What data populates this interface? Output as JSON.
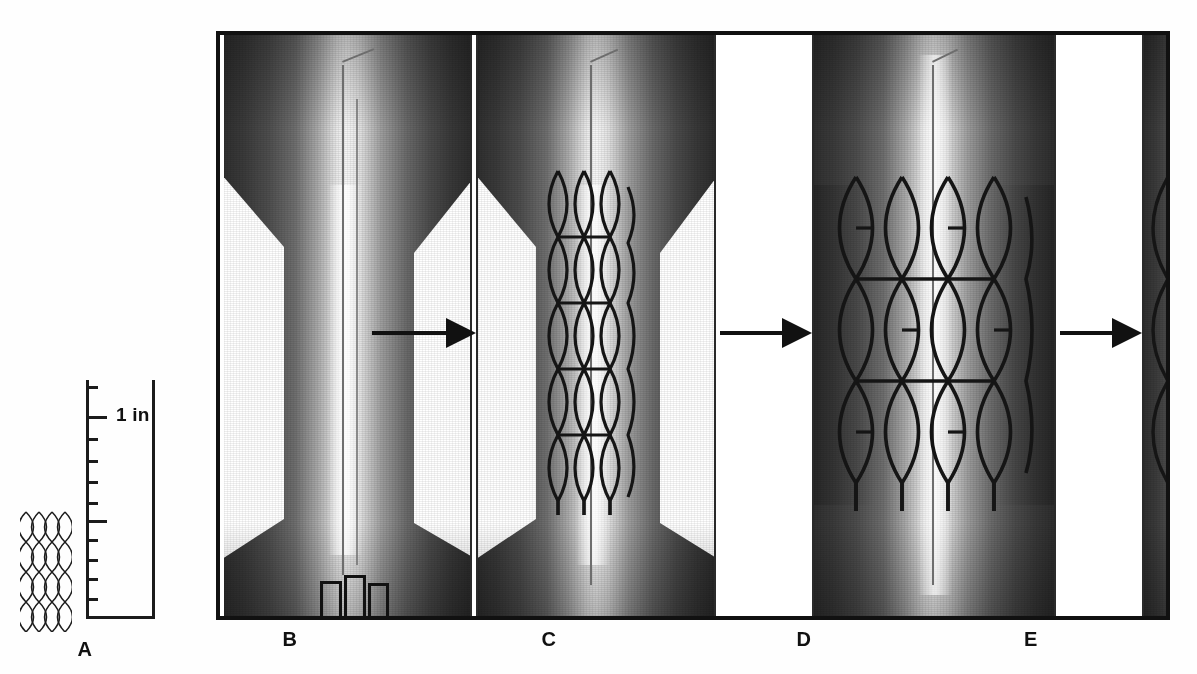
{
  "figure": {
    "kind": "medical-illustration-sequence"
  },
  "scale": {
    "label": "1 in",
    "major_tick_count": 2,
    "minor_tick_count": 11
  },
  "panels": [
    {
      "id": "a",
      "letter": "A",
      "content": "compressed braided stent alongside inch scale"
    },
    {
      "id": "b",
      "letter": "B",
      "content": "stenosed vessel with guidewire and catheter tip"
    },
    {
      "id": "c",
      "letter": "C",
      "content": "constrained stent positioned across the stenosis"
    },
    {
      "id": "d",
      "letter": "D",
      "content": "stent expanded, vessel lumen restored"
    },
    {
      "id": "e",
      "letter": "E",
      "content": "final deployed stent, delivery system withdrawn"
    }
  ],
  "arrows": [
    {
      "id": "arrow-b-c",
      "direction": "right"
    },
    {
      "id": "arrow-c-d",
      "direction": "right"
    },
    {
      "id": "arrow-d-e",
      "direction": "right"
    }
  ],
  "colors": {
    "ink": "#111111",
    "vessel_dark": "#2f2f2f",
    "vessel_light": "#f6f6f6",
    "stent_line": "#151515",
    "background": "#ffffff"
  }
}
